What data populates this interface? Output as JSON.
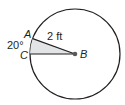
{
  "diagram": {
    "type": "circle-sector",
    "center_label": "B",
    "point_a_label": "A",
    "point_c_label": "C",
    "radius_label": "2 ft",
    "angle_label": "20°",
    "colors": {
      "stroke": "#231f20",
      "sector_fill": "#e3e4e5",
      "background": "#ffffff"
    }
  }
}
